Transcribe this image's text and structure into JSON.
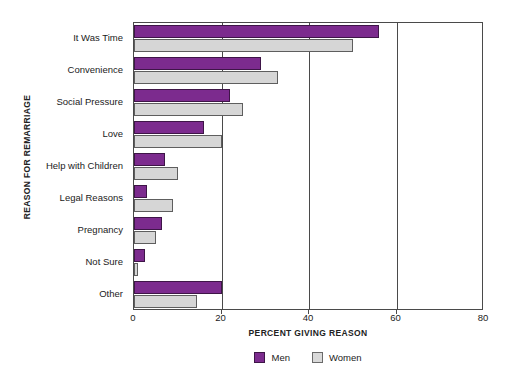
{
  "top_caption": "",
  "chart_data": {
    "type": "bar",
    "orientation": "horizontal",
    "title": "",
    "xlabel": "PERCENT GIVING REASON",
    "ylabel": "REASON FOR REMARRIAGE",
    "xlim": [
      0,
      80
    ],
    "xticks": [
      0,
      20,
      40,
      60,
      80
    ],
    "xtick_labels": [
      "0",
      "20",
      "40",
      "60",
      "80"
    ],
    "grid": true,
    "legend_position": "bottom-center",
    "categories": [
      "It Was Time",
      "Convenience",
      "Social Pressure",
      "Love",
      "Help with Children",
      "Legal Reasons",
      "Pregnancy",
      "Not Sure",
      "Other"
    ],
    "series": [
      {
        "name": "Men",
        "color": "#7c2b8e",
        "values": [
          56,
          29,
          22,
          16,
          7,
          3,
          6.5,
          2.5,
          20
        ]
      },
      {
        "name": "Women",
        "color": "#d6d6d6",
        "values": [
          50,
          33,
          25,
          20,
          10,
          9,
          5,
          1,
          14.5
        ]
      }
    ]
  }
}
